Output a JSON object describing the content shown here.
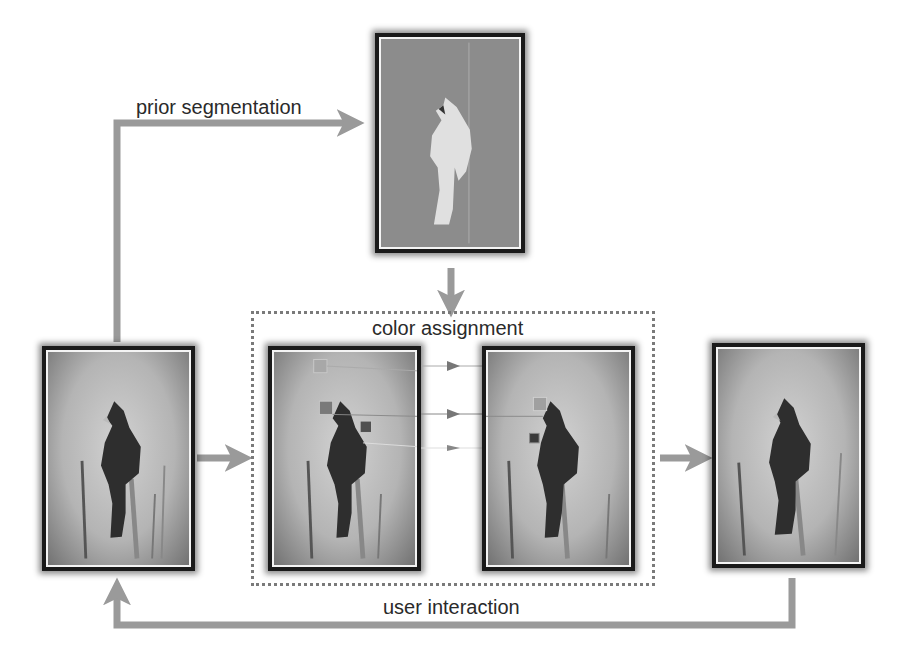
{
  "diagram": {
    "type": "workflow",
    "labels": {
      "prior_segmentation": "prior segmentation",
      "color_assignment": "color assignment",
      "user_interaction": "user interaction"
    },
    "nodes": [
      {
        "id": "input_image",
        "description": "grayscale photo of cardinal on branch"
      },
      {
        "id": "segmentation_mask",
        "description": "light bird silhouette on gray background"
      },
      {
        "id": "color_source",
        "description": "bird photo with color sample boxes"
      },
      {
        "id": "color_target",
        "description": "bird photo with assigned color boxes"
      },
      {
        "id": "output_image",
        "description": "colorized cardinal photo"
      }
    ],
    "edges": [
      {
        "from": "input_image",
        "to": "segmentation_mask",
        "label": "prior segmentation"
      },
      {
        "from": "segmentation_mask",
        "to": "color_assignment_group"
      },
      {
        "from": "input_image",
        "to": "color_assignment_group"
      },
      {
        "from": "color_assignment_group",
        "to": "output_image"
      },
      {
        "from": "output_image",
        "to": "input_image",
        "label": "user interaction"
      }
    ],
    "colors": {
      "arrow": "#9a9a9a",
      "frame": "#1a1a1a",
      "dotted_border": "#7a7a7a",
      "mask_background": "#8c8c8c",
      "mask_foreground": "#e0e0e0",
      "text": "#2a2a2a"
    }
  }
}
